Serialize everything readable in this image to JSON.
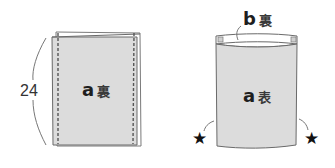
{
  "diagram": {
    "type": "sewing-instruction",
    "left_panel": {
      "fabric_label": "a",
      "side_label": "裏",
      "dimension": "24",
      "stitch_lines": 2
    },
    "right_panel": {
      "fabric_label": "a",
      "side_label": "表",
      "lining_label": "b",
      "lining_side_label": "裏",
      "markers": [
        "★",
        "★"
      ]
    },
    "colors": {
      "fabric_fill": "#dcdcdc",
      "outline": "#6a6a6a",
      "stitch": "#555555",
      "text": "#2a2a2a"
    }
  }
}
